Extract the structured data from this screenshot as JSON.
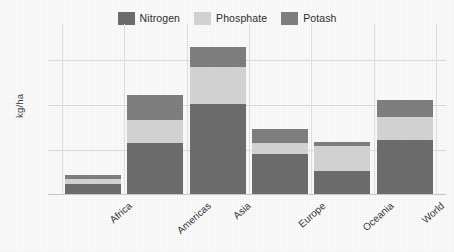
{
  "chart_data": {
    "type": "bar",
    "subtype": "stacked-bar",
    "title": "",
    "xlabel": "",
    "ylabel": "kg/ha",
    "ylim": [
      0,
      175
    ],
    "yticks": [
      0,
      50,
      100,
      150
    ],
    "ytick_labels": [
      "0",
      "50",
      "100",
      "150"
    ],
    "grid": "horizontal-and-vertical",
    "legend_position": "top-center",
    "categories": [
      "Africa",
      "Americas",
      "Asia",
      "Europe",
      "Oceania",
      "World"
    ],
    "series": [
      {
        "name": "Nitrogen",
        "color": "#6e6e6e",
        "values": [
          12,
          58,
          102,
          46,
          27,
          61
        ]
      },
      {
        "name": "Phosphate",
        "color": "#d5d5d5",
        "values": [
          6,
          26,
          41,
          12,
          28,
          26
        ]
      },
      {
        "name": "Potash",
        "color": "#808080",
        "values": [
          4,
          28,
          22,
          16,
          4,
          19
        ]
      }
    ],
    "totals": [
      22,
      112,
      165,
      74,
      59,
      106
    ]
  },
  "legend": {
    "items": [
      {
        "label": "Nitrogen",
        "swatch": "legend-swatch-nitrogen"
      },
      {
        "label": "Phosphate",
        "swatch": "legend-swatch-phosphate"
      },
      {
        "label": "Potash",
        "swatch": "legend-swatch-potash"
      }
    ]
  },
  "axes": {
    "y_axis_title": "kg/ha",
    "y_tick_labels": [
      "150",
      "100",
      "50",
      "0"
    ],
    "x_tick_labels": [
      "Africa",
      "Americas",
      "Asia",
      "Europe",
      "Oceania",
      "World"
    ]
  },
  "colors": {
    "nitrogen": "#6e6e6e",
    "phosphate": "#d5d5d5",
    "potash": "#808080",
    "gridline": "#dcdcdc",
    "background": "#fcfcfc",
    "text": "#3a3a3a"
  }
}
